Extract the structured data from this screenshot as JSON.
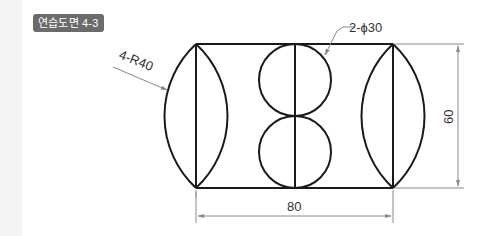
{
  "title_badge": "연습도면 4-3",
  "annotations": {
    "radius_label": "4-R40",
    "circle_label": "2-ϕ30",
    "width_dimension": "80",
    "height_dimension": "60"
  },
  "colors": {
    "badge_bg": "#6b6b6b",
    "object_line": "#1a1a1a",
    "dimension_line": "#8a8a8a"
  }
}
